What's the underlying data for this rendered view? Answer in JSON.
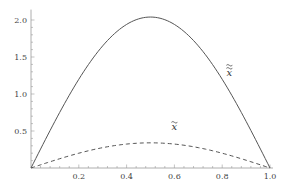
{
  "chart_data": {
    "type": "line",
    "title": "",
    "xlabel": "",
    "ylabel": "",
    "xlim": [
      0,
      1.0
    ],
    "ylim": [
      0,
      2.1
    ],
    "grid": false,
    "legend": "inline labels",
    "x_ticks": [
      0.2,
      0.4,
      0.6,
      0.8,
      1.0
    ],
    "x_tick_labels": [
      "0.2",
      "0.4",
      "0.6",
      "0.8",
      "1.0"
    ],
    "y_ticks": [
      0.5,
      1.0,
      1.5,
      2.0
    ],
    "y_tick_labels": [
      "0.5",
      "1.0",
      "1.5",
      "2.0"
    ],
    "x": [
      0,
      0.1,
      0.2,
      0.3,
      0.4,
      0.5,
      0.6,
      0.7,
      0.8,
      0.9,
      1.0
    ],
    "series": [
      {
        "name": "x double tilde",
        "label": "x̃̃",
        "style": "solid",
        "color": "#555555",
        "values": [
          0,
          0.63,
          1.2,
          1.65,
          1.94,
          2.04,
          1.94,
          1.65,
          1.2,
          0.63,
          0
        ]
      },
      {
        "name": "x tilde",
        "label": "x̃",
        "style": "dashed",
        "color": "#555555",
        "values": [
          0,
          0.105,
          0.2,
          0.275,
          0.323,
          0.34,
          0.323,
          0.275,
          0.2,
          0.105,
          0
        ]
      }
    ],
    "annotations": [
      {
        "text": "x̃̃",
        "x": 0.83,
        "y": 1.25,
        "series": "solid"
      },
      {
        "text": "x̃",
        "x": 0.6,
        "y": 0.52,
        "series": "dashed"
      }
    ]
  },
  "plot": {
    "origin_px": [
      31,
      168
    ],
    "x_scale_px_per_unit": 239,
    "y_scale_px_per_unit": 74
  }
}
